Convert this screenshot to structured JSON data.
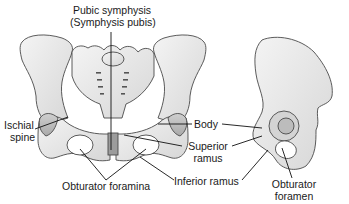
{
  "diagram": {
    "views": [
      "anterior view of pelvis",
      "lateral view of hip bone"
    ],
    "labels": {
      "pubic_symphysis_line1": "Pubic symphysis",
      "pubic_symphysis_line2": "(Symphysis pubis)",
      "ischial_spine_line1": "Ischial",
      "ischial_spine_line2": "spine",
      "body": "Body",
      "superior_ramus_line1": "Superior",
      "superior_ramus_line2": "ramus",
      "inferior_ramus": "Inferior ramus",
      "obturator_foramina": "Obturator foramina",
      "obturator_foramen_line1": "Obturator",
      "obturator_foramen_line2": "foramen"
    },
    "colors": {
      "bone_fill": "#e8e8e8",
      "bone_shade": "#bdbdbd",
      "outline": "#4a4a4a",
      "leader_line": "#111111",
      "text": "#1a1a1a"
    }
  }
}
